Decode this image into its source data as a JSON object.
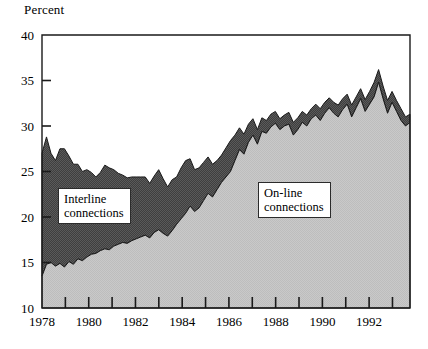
{
  "chart_data": {
    "type": "area",
    "title": "",
    "ylabel": "Percent",
    "xlabel": "",
    "ylim": [
      10,
      40
    ],
    "ytick_values": [
      10,
      15,
      20,
      25,
      30,
      35,
      40
    ],
    "ytick_labels": [
      "10",
      "15",
      "20",
      "25",
      "30",
      "35",
      "40"
    ],
    "xlim": [
      1978,
      1993.75
    ],
    "xtick_labels": [
      "1978",
      "1980",
      "1982",
      "1984",
      "1986",
      "1988",
      "1990",
      "1992"
    ],
    "xtick_label_values": [
      1978,
      1980,
      1982,
      1984,
      1986,
      1988,
      1990,
      1992
    ],
    "xtick_minor_values": [
      1979,
      1981,
      1983,
      1985,
      1987,
      1989,
      1991,
      1993
    ],
    "grid": false,
    "stacked": true,
    "legend_position": "inline-annotation",
    "series": [
      {
        "name": "On-line connections",
        "fill": "#c4c4c4",
        "label_text_line1": "On-line",
        "label_text_line2": "connections",
        "values": [
          13.5,
          14.8,
          15.0,
          14.6,
          14.9,
          14.5,
          15.1,
          14.8,
          15.4,
          15.2,
          15.6,
          15.9,
          16.0,
          16.3,
          16.5,
          16.4,
          16.8,
          17.0,
          17.2,
          17.1,
          17.4,
          17.6,
          17.8,
          18.0,
          17.7,
          18.3,
          18.6,
          18.2,
          17.9,
          18.5,
          19.2,
          19.8,
          20.4,
          21.2,
          20.6,
          21.0,
          21.8,
          22.6,
          22.2,
          23.0,
          23.8,
          24.4,
          25.0,
          26.2,
          27.4,
          26.9,
          28.2,
          29.0,
          28.0,
          29.4,
          29.2,
          29.9,
          30.3,
          29.6,
          30.0,
          30.2,
          29.0,
          29.6,
          30.4,
          30.0,
          30.8,
          31.2,
          30.6,
          31.4,
          32.0,
          31.4,
          31.0,
          31.8,
          32.4,
          31.0,
          32.0,
          33.0,
          31.6,
          32.4,
          33.2,
          34.8,
          33.0,
          31.4,
          32.6,
          31.6,
          30.6,
          30.0,
          30.4
        ]
      },
      {
        "name": "Interline connections",
        "fill": "#4a4a4a",
        "label_text_line1": "Interline",
        "label_text_line2": "connections",
        "values": [
          13.5,
          14.0,
          12.0,
          11.6,
          12.6,
          13.0,
          11.6,
          11.0,
          10.4,
          9.8,
          9.6,
          9.0,
          8.4,
          8.6,
          9.2,
          9.0,
          8.4,
          7.8,
          7.4,
          7.2,
          7.0,
          6.8,
          6.6,
          6.4,
          6.0,
          6.2,
          6.6,
          6.0,
          5.4,
          5.6,
          5.2,
          5.6,
          5.8,
          5.2,
          4.6,
          4.4,
          4.2,
          4.0,
          3.6,
          3.2,
          3.0,
          3.2,
          3.4,
          2.8,
          2.4,
          2.2,
          2.0,
          1.8,
          1.6,
          1.5,
          1.4,
          1.4,
          1.3,
          1.2,
          1.2,
          1.3,
          1.4,
          1.3,
          1.2,
          1.2,
          1.1,
          1.2,
          1.3,
          1.2,
          1.1,
          1.2,
          1.3,
          1.2,
          1.1,
          1.3,
          1.2,
          1.1,
          1.3,
          1.4,
          1.6,
          1.4,
          1.3,
          1.2,
          1.3,
          1.2,
          1.1,
          1.0,
          0.9
        ]
      }
    ],
    "total_top_values": [
      27.0,
      28.8,
      27.0,
      26.2,
      27.5,
      27.5,
      26.7,
      25.8,
      25.8,
      25.0,
      25.2,
      24.9,
      24.4,
      24.9,
      25.7,
      25.4,
      25.2,
      24.8,
      24.6,
      24.3,
      24.4,
      24.4,
      24.4,
      24.4,
      23.7,
      24.5,
      25.2,
      24.2,
      23.3,
      24.1,
      24.4,
      25.4,
      26.2,
      26.4,
      25.2,
      25.4,
      26.0,
      26.6,
      25.8,
      26.2,
      26.8,
      27.6,
      28.4,
      29.0,
      29.8,
      29.1,
      30.2,
      30.8,
      29.6,
      30.9,
      30.6,
      31.3,
      31.6,
      30.8,
      31.2,
      31.5,
      30.4,
      30.9,
      31.6,
      31.2,
      31.9,
      32.4,
      31.9,
      32.6,
      33.1,
      32.6,
      32.3,
      33.0,
      33.5,
      32.3,
      33.2,
      34.1,
      32.9,
      33.8,
      34.8,
      36.2,
      34.4,
      32.8,
      33.8,
      32.8,
      31.9,
      31.0,
      31.3
    ]
  },
  "axis": {
    "y_title": "Percent"
  }
}
